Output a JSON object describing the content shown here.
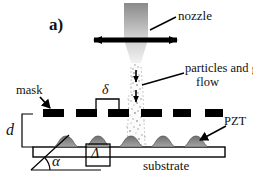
{
  "figure": {
    "panel_label": "a)",
    "caption_type": "schematic-diagram"
  },
  "labels": {
    "nozzle": "nozzle",
    "particles_line1": "particles and gas",
    "particles_line2": "flow",
    "mask": "mask",
    "pzt": "PZT",
    "substrate": "substrate",
    "gap_symbol": "d",
    "slit_symbol": "δ",
    "pitch_symbol": "Δ",
    "angle_symbol": "α"
  },
  "colors": {
    "ink": "#000000",
    "nozzle_top": "#7d7d7d",
    "nozzle_bottom": "#e8e8e8",
    "mask_fill": "#000000",
    "pzt_fill": "#8c8c8c",
    "spray": "#9a9a9a",
    "background": "#ffffff"
  },
  "geometry": {
    "nozzle_body": {
      "x": 124,
      "y": 3,
      "w": 24,
      "h": 36
    },
    "nozzle_cone": {
      "top_left": 124,
      "top_right": 148,
      "bottom_left": 131,
      "bottom_right": 141,
      "y_top": 39,
      "y_bottom": 63
    },
    "scan_arrow": {
      "x1": 90,
      "x2": 181,
      "y": 40
    },
    "mask_bars": [
      {
        "x": 43,
        "y": 109,
        "w": 21,
        "h": 8
      },
      {
        "x": 76,
        "y": 109,
        "w": 21,
        "h": 8
      },
      {
        "x": 108,
        "y": 109,
        "w": 21,
        "h": 8
      },
      {
        "x": 141,
        "y": 109,
        "w": 21,
        "h": 8
      },
      {
        "x": 173,
        "y": 109,
        "w": 18,
        "h": 8
      },
      {
        "x": 205,
        "y": 109,
        "w": 18,
        "h": 8
      }
    ],
    "substrate_bar": {
      "x": 33,
      "y": 147,
      "w": 192,
      "h": 10
    },
    "pzt_mounds_cx": [
      66,
      98,
      131,
      163,
      196
    ],
    "pzt_mound": {
      "w": 26,
      "h": 12,
      "base_y": 147
    },
    "delta_bracket": {
      "x1": 96,
      "x2": 119,
      "y_top": 99,
      "y_bottom": 109
    },
    "d_bracket": {
      "x": 22,
      "y_top": 114,
      "y_bottom": 147
    },
    "pitch_box": {
      "x": 86,
      "y": 144,
      "w": 24,
      "h": 22
    },
    "angle_baseline": {
      "x1": 31,
      "x2": 101,
      "y": 170
    },
    "angle_hyp": {
      "x1": 31,
      "y1": 170,
      "x2": 67,
      "y2": 136
    },
    "spray": {
      "x_center": 136,
      "y_top": 63,
      "y_bottom": 147,
      "half_width_top": 3,
      "half_width_bottom": 7
    }
  }
}
